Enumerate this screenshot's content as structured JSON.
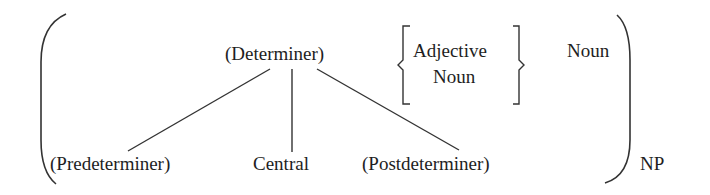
{
  "diagram": {
    "type": "noun-phrase-structure",
    "outer_bracket_label": "NP",
    "determiner": {
      "label": "(Determiner)",
      "children": [
        "(Predeterminer)",
        "Central",
        "(Postdeterminer)"
      ]
    },
    "modifier_choice": {
      "options": [
        "Adjective",
        "Noun"
      ]
    },
    "head": {
      "label": "Noun"
    }
  },
  "colors": {
    "ink": "#1e1e1e",
    "background": "#ffffff"
  }
}
